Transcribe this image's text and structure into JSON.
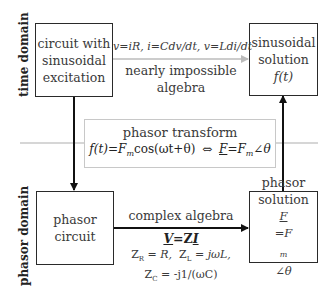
{
  "domain_labels": {
    "time": "time domain",
    "phasor": "phasor domain"
  },
  "boxes": {
    "time_circuit": {
      "lines": [
        "circuit with",
        "sinusoidal",
        "excitation"
      ]
    },
    "time_solution": {
      "lines": [
        "sinusoidal",
        "solution"
      ],
      "formula": "f(t)"
    },
    "phasor_circuit": {
      "lines": [
        "phasor",
        "circuit"
      ]
    },
    "phasor_solution": {
      "lines": [
        "phasor",
        "solution"
      ],
      "formula_F": "F",
      "formula_rest": "=F",
      "formula_sub": "m",
      "formula_angle": "∠θ"
    }
  },
  "time_arrow": {
    "equations": "v=iR, i=Cdv/dt, v=Ldi/dt",
    "label_line1": "nearly impossible",
    "label_line2": "algebra"
  },
  "transform": {
    "title": "phasor transform",
    "lhs": "f(t)=F",
    "lhs_sub": "m",
    "lhs_rest": "cos(ωt+θ)",
    "equiv": "⇔",
    "rhs_F": "F",
    "rhs_rest": "=F",
    "rhs_sub": "m",
    "rhs_angle": "∠θ"
  },
  "phasor_arrow": {
    "label": "complex algebra",
    "ohm_V": "V",
    "ohm_mid": "=Z",
    "ohm_I": "I",
    "zr": "Z",
    "zr_sub": "R",
    "zr_rest": " = R,",
    "zl": "Z",
    "zl_sub": "L",
    "zl_rest": " = jωL,",
    "zc": "Z",
    "zc_sub": "C",
    "zc_rest": " = -j1/(ωC)"
  },
  "colors": {
    "box_border": "#2a2a2a",
    "arrow_black": "#111111",
    "arrow_gray": "#bbbbbb",
    "divider_gray": "#c8c8c8",
    "text": "#3a3a3a"
  }
}
